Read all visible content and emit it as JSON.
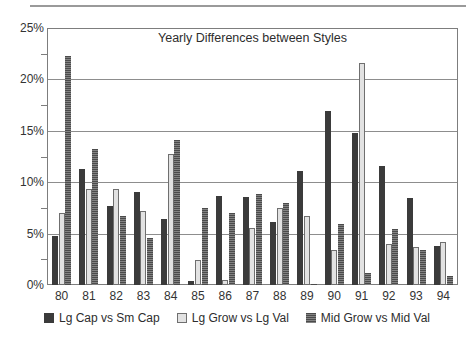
{
  "chart_data": {
    "type": "bar",
    "title": "Yearly Differences between Styles",
    "xlabel": "",
    "ylabel": "",
    "ylim": [
      0,
      25
    ],
    "yticks": [
      "0%",
      "5%",
      "10%",
      "15%",
      "20%",
      "25%"
    ],
    "ytick_values": [
      0,
      5,
      10,
      15,
      20,
      25
    ],
    "minor_ticks": [
      2.5,
      7.5,
      12.5,
      17.5,
      22.5
    ],
    "grid": true,
    "legend_position": "bottom",
    "categories": [
      "80",
      "81",
      "82",
      "83",
      "84",
      "85",
      "86",
      "87",
      "88",
      "89",
      "90",
      "91",
      "92",
      "93",
      "94"
    ],
    "series": [
      {
        "name": "Lg Cap vs Sm Cap",
        "color": "#3b3b3b",
        "values": [
          4.8,
          11.3,
          7.7,
          9.1,
          6.4,
          0.4,
          8.7,
          8.6,
          6.2,
          11.1,
          17.0,
          14.8,
          11.6,
          8.5,
          3.8
        ]
      },
      {
        "name": "Lg Grow vs Lg Val",
        "color": "#e2e2e2",
        "values": [
          7.0,
          9.4,
          9.4,
          7.2,
          12.8,
          2.4,
          0.5,
          5.6,
          7.5,
          6.7,
          3.4,
          21.7,
          4.0,
          3.7,
          4.2
        ]
      },
      {
        "name": "Mid Grow vs Mid Val",
        "color": "#6b6b6b",
        "values": [
          22.4,
          13.3,
          6.7,
          4.6,
          14.2,
          7.5,
          7.0,
          8.9,
          8.0,
          0.1,
          6.0,
          1.2,
          5.5,
          3.4,
          0.9
        ]
      }
    ]
  }
}
